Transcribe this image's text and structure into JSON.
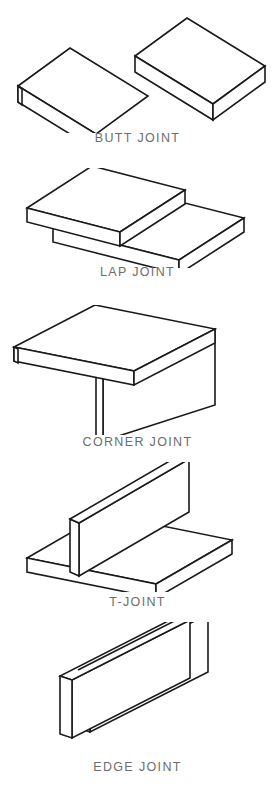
{
  "diagram": {
    "background_color": "#ffffff",
    "line_color": "#1a1a1a",
    "label_color": "#6d6d6d",
    "figure_count": 5,
    "projection": "isometric",
    "figures": [
      {
        "id": "butt-joint",
        "label": "BUTT JOINT",
        "label_y": 137,
        "description": "Two flat plates laid edge to edge in the same plane, joined along a seam running the length of the plates.",
        "piece_count": 2
      },
      {
        "id": "lap-joint",
        "label": "LAP JOINT",
        "label_y": 271,
        "description": "Two flat plates overlapping one another, the upper plate resting on top of the lower plate.",
        "piece_count": 2
      },
      {
        "id": "corner-joint",
        "label": "CORNER JOINT",
        "label_y": 441,
        "description": "Two plates meeting at a right angle at their outer corner, one horizontal on top and one vertical beneath.",
        "piece_count": 2
      },
      {
        "id": "t-joint",
        "label": "T-JOINT",
        "label_y": 601,
        "description": "A vertical plate standing perpendicular on the face of a horizontal base plate forming a T shape.",
        "piece_count": 2
      },
      {
        "id": "edge-joint",
        "label": "EDGE JOINT",
        "label_y": 766,
        "description": "Two plates placed face to face standing on edge, joined along their common top edge.",
        "piece_count": 2
      }
    ]
  }
}
